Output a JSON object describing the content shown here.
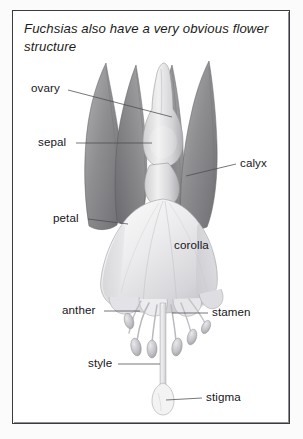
{
  "figure": {
    "title": "Fuchsias also have a very obvious flower structure",
    "medium": "graphite pencil drawing",
    "frame_color": "#3b3b3f",
    "background_color": "#ffffff",
    "text_color": "#16161a"
  },
  "labels": {
    "ovary": "ovary",
    "sepal": "sepal",
    "petal": "petal",
    "corolla": "corolla",
    "calyx": "calyx",
    "anther": "anther",
    "stamen": "stamen",
    "style": "style",
    "stigma": "stigma"
  },
  "diagram_parts": [
    {
      "name": "ovary",
      "label": "ovary",
      "leader": true,
      "side": "left"
    },
    {
      "name": "sepal",
      "label": "sepal",
      "leader": true,
      "side": "left"
    },
    {
      "name": "petal",
      "label": "petal",
      "leader": true,
      "side": "left"
    },
    {
      "name": "corolla",
      "label": "corolla",
      "leader": false,
      "side": "inset"
    },
    {
      "name": "calyx",
      "label": "calyx",
      "leader": true,
      "side": "right"
    },
    {
      "name": "anther",
      "label": "anther",
      "leader": true,
      "side": "left"
    },
    {
      "name": "stamen",
      "label": "stamen",
      "leader": true,
      "side": "right"
    },
    {
      "name": "style",
      "label": "style",
      "leader": true,
      "side": "left"
    },
    {
      "name": "stigma",
      "label": "stigma",
      "leader": true,
      "side": "right"
    }
  ]
}
